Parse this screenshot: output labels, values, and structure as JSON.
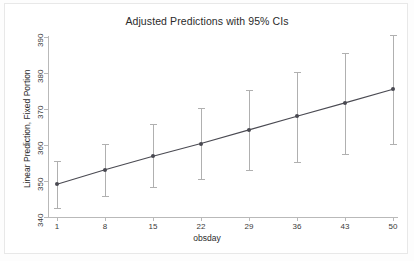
{
  "figure": {
    "background_color": "#ffffff",
    "frame_color": "#e8e8e8"
  },
  "chart_data": {
    "type": "line",
    "title": "Adjusted Predictions with 95% CIs",
    "xlabel": "obsday",
    "ylabel": "Linear Prediction, Fixed Portion",
    "x": [
      1,
      8,
      15,
      22,
      29,
      36,
      43,
      50
    ],
    "values": [
      349.1,
      353.1,
      356.9,
      360.4,
      364.2,
      368.0,
      371.7,
      375.5
    ],
    "ci_lower": [
      342.6,
      345.7,
      348.3,
      350.6,
      353.0,
      355.4,
      357.6,
      360.3
    ],
    "ci_upper": [
      355.6,
      360.4,
      365.7,
      370.3,
      375.2,
      380.4,
      385.6,
      390.5
    ],
    "xticks": [
      1,
      8,
      15,
      22,
      29,
      36,
      43,
      50
    ],
    "xticklabels": [
      "1",
      "8",
      "15",
      "22",
      "29",
      "36",
      "43",
      "50"
    ],
    "yticks": [
      340,
      350,
      360,
      370,
      380,
      390
    ],
    "yticklabels": [
      "340",
      "350",
      "360",
      "370",
      "380",
      "390"
    ],
    "xlim": [
      1,
      50
    ],
    "ylim": [
      340,
      390
    ],
    "grid": false,
    "legend": "none",
    "line_color": "#4a4a52",
    "marker_color": "#4a4a52",
    "errorbar_color": "#b0b0b0",
    "axis_color": "#b9b9b9",
    "ci_level": "95%"
  }
}
